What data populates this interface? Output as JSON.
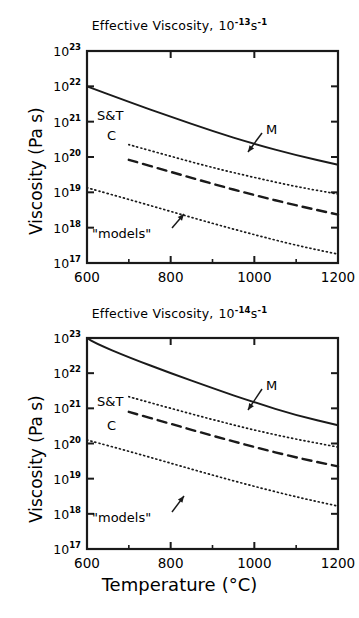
{
  "figure": {
    "axis_labels": {
      "x": "Temperature",
      "x_unit": "(°C)",
      "y": "Viscosity (Pa s)"
    }
  },
  "chart_data": [
    {
      "type": "line",
      "panel": "top",
      "title_prefix": "Effective Viscosity,",
      "title_base": "10",
      "title_exp": "-13",
      "title_unit": "s",
      "title_unit_exp": "-1",
      "title_plain": "Effective Viscosity, 10^-13 s^-1",
      "xlabel": "",
      "ylabel": "Viscosity (Pa s)",
      "xlim": [
        600,
        1200
      ],
      "ylim_log10": [
        17,
        23
      ],
      "xticks": [
        600,
        800,
        1000,
        1200
      ],
      "xtick_labels": [
        "600",
        "800",
        "1000",
        "1200"
      ],
      "yticks_log10": [
        17,
        18,
        19,
        20,
        21,
        22,
        23
      ],
      "ytick_labels": [
        "10^17",
        "10^18",
        "10^19",
        "10^20",
        "10^21",
        "10^22",
        "10^23"
      ],
      "grid": false,
      "legend_position": "inline-annotations",
      "series": [
        {
          "name": "M",
          "style": "solid",
          "label": "M",
          "x": [
            600,
            700,
            800,
            900,
            1000,
            1100,
            1200
          ],
          "y_log10": [
            22.0,
            21.56,
            21.14,
            20.73,
            20.37,
            20.05,
            19.78
          ]
        },
        {
          "name": "S&T",
          "style": "dotted",
          "label": "S&T",
          "x": [
            700,
            800,
            900,
            1000,
            1100,
            1200
          ],
          "y_log10": [
            20.35,
            20.02,
            19.7,
            19.42,
            19.16,
            18.95
          ]
        },
        {
          "name": "C",
          "style": "dashed",
          "label": "C",
          "x": [
            700,
            800,
            900,
            1000,
            1100,
            1200
          ],
          "y_log10": [
            19.92,
            19.58,
            19.24,
            18.92,
            18.63,
            18.37
          ]
        },
        {
          "name": "models",
          "style": "dotted",
          "label": "\"models\"",
          "x": [
            600,
            700,
            800,
            900,
            1000,
            1100,
            1200
          ],
          "y_log10": [
            19.13,
            18.8,
            18.46,
            18.12,
            17.8,
            17.5,
            17.25
          ]
        }
      ],
      "annotations": [
        {
          "text": "S&T",
          "x_px": 97,
          "y_px": 108
        },
        {
          "text": "C",
          "x_px": 107,
          "y_px": 128
        },
        {
          "text": "M",
          "x_px": 266,
          "y_px": 122
        },
        {
          "text": "\"models\"",
          "x_px": 92,
          "y_px": 226
        }
      ]
    },
    {
      "type": "line",
      "panel": "bottom",
      "title_prefix": "Effective Viscosity,",
      "title_base": "10",
      "title_exp": "-14",
      "title_unit": "s",
      "title_unit_exp": "-1",
      "title_plain": "Effective Viscosity, 10^-14 s^-1",
      "xlabel": "Temperature (°C)",
      "ylabel": "Viscosity (Pa s)",
      "xlim": [
        600,
        1200
      ],
      "ylim_log10": [
        17,
        23
      ],
      "xticks": [
        600,
        800,
        1000,
        1200
      ],
      "xtick_labels": [
        "600",
        "800",
        "1000",
        "1200"
      ],
      "yticks_log10": [
        17,
        18,
        19,
        20,
        21,
        22,
        23
      ],
      "ytick_labels": [
        "10^17",
        "10^18",
        "10^19",
        "10^20",
        "10^21",
        "10^22",
        "10^23"
      ],
      "grid": false,
      "legend_position": "inline-annotations",
      "series": [
        {
          "name": "M",
          "style": "solid",
          "label": "M",
          "x": [
            600,
            620,
            700,
            800,
            900,
            1000,
            1100,
            1200
          ],
          "y_log10": [
            23.0,
            22.85,
            22.45,
            22.0,
            21.57,
            21.17,
            20.8,
            20.52
          ]
        },
        {
          "name": "S&T",
          "style": "dotted",
          "label": "S&T",
          "x": [
            700,
            800,
            900,
            1000,
            1100,
            1200
          ],
          "y_log10": [
            21.33,
            21.0,
            20.68,
            20.38,
            20.12,
            19.9
          ]
        },
        {
          "name": "C",
          "style": "dashed",
          "label": "C",
          "x": [
            700,
            800,
            900,
            1000,
            1100,
            1200
          ],
          "y_log10": [
            20.9,
            20.56,
            20.22,
            19.9,
            19.6,
            19.35
          ]
        },
        {
          "name": "models",
          "style": "dotted",
          "label": "\"models\"",
          "x": [
            600,
            700,
            800,
            900,
            1000,
            1100,
            1200
          ],
          "y_log10": [
            20.1,
            19.78,
            19.44,
            19.1,
            18.78,
            18.48,
            18.22
          ]
        }
      ],
      "annotations": [
        {
          "text": "S&T",
          "x_px": 97,
          "y_px": 106
        },
        {
          "text": "C",
          "x_px": 107,
          "y_px": 130
        },
        {
          "text": "M",
          "x_px": 266,
          "y_px": 90
        },
        {
          "text": "\"models\"",
          "x_px": 92,
          "y_px": 222
        }
      ]
    }
  ]
}
